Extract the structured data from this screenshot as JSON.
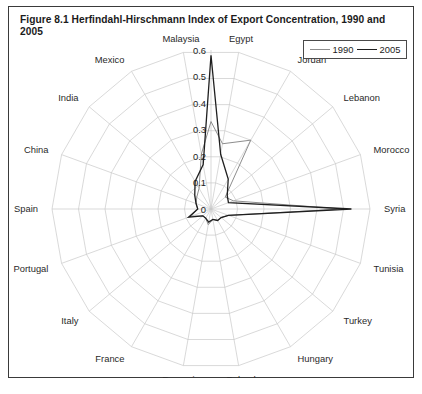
{
  "figure": {
    "caption": "Figure 8.1  Herfindahl-Hirschmann Index of Export Concentration, 1990 and 2005"
  },
  "legend": {
    "position": "top-right",
    "entries": [
      {
        "label": "1990",
        "color": "#8d8d8d"
      },
      {
        "label": "2005",
        "color": "#1f1f1f"
      }
    ]
  },
  "axis": {
    "tick_labels": [
      "0",
      "0.1",
      "0.2",
      "0.3",
      "0.4",
      "0.5",
      "0.6"
    ],
    "tick_values": [
      0,
      0.1,
      0.2,
      0.3,
      0.4,
      0.5,
      0.6
    ]
  },
  "chart_data": {
    "type": "radar",
    "title": "Figure 8.1  Herfindahl-Hirschmann Index of Export Concentration, 1990 and 2005",
    "xlabel": "",
    "ylabel": "",
    "ylim": [
      0,
      0.6
    ],
    "grid": true,
    "legend_position": "top-right",
    "categories": [
      "Egypt",
      "Jordan",
      "Lebanon",
      "Morocco",
      "Syria",
      "Tunisia",
      "Turkey",
      "Hungary",
      "Poland",
      "Romania",
      "France",
      "Italy",
      "Portugal",
      "Spain",
      "China",
      "India",
      "Mexico",
      "Malaysia"
    ],
    "series": [
      {
        "name": "1990",
        "color": "#8d8d8d",
        "values": [
          0.25,
          0.3,
          0.07,
          0.09,
          0.5,
          0.07,
          0.05,
          0.05,
          0.04,
          0.06,
          0.04,
          0.04,
          0.08,
          0.05,
          0.06,
          0.07,
          0.09,
          0.21
        ]
      },
      {
        "name": "2005",
        "color": "#1f1f1f",
        "values": [
          0.21,
          0.13,
          0.08,
          0.07,
          0.53,
          0.07,
          0.05,
          0.05,
          0.04,
          0.05,
          0.04,
          0.04,
          0.09,
          0.05,
          0.06,
          0.08,
          0.12,
          0.17
        ]
      }
    ],
    "vertical_axis_peak": {
      "note": "tick-label spoke between Malaysia and Egypt",
      "values_1990": 0.33,
      "values_2005": 0.58
    }
  },
  "geometry": {
    "center_x": 203,
    "center_y": 203,
    "radius": 159,
    "spoke_count": 18,
    "start_angle_deg": -90
  }
}
